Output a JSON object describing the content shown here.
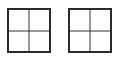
{
  "diagram": {
    "grids": [
      {
        "id": "grid-left",
        "rows": 2,
        "cols": 2
      },
      {
        "id": "grid-right",
        "rows": 2,
        "cols": 2
      }
    ],
    "colors": {
      "line": "#2a2a2a",
      "background": "#ffffff"
    }
  }
}
